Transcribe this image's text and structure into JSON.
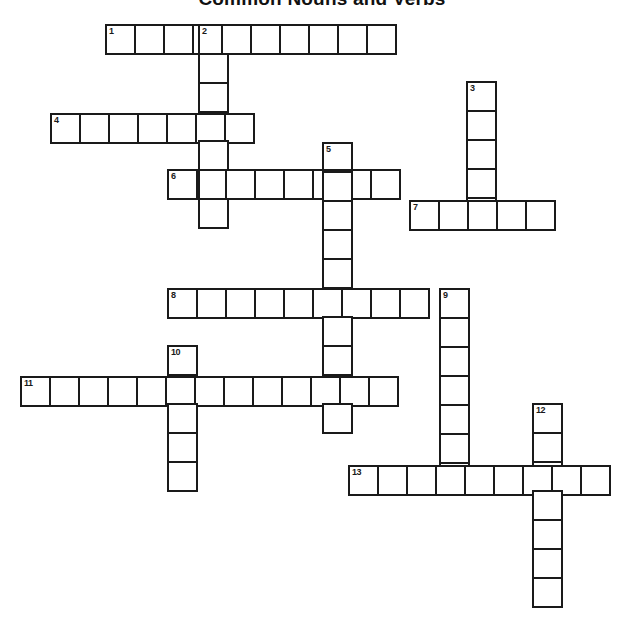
{
  "page": {
    "title": "Common Nouns and Verbs",
    "background_color": "#ffffff",
    "width": 644,
    "height": 631
  },
  "grid": {
    "cell_size": 31,
    "border_color": "#1a1a1a",
    "cell_fill": "#ffffff",
    "origin_x": 105,
    "origin_y": 24,
    "numbered_count": 13
  },
  "clue_numbers": [
    1,
    2,
    3,
    4,
    5,
    6,
    7,
    8,
    9,
    10,
    11,
    12,
    13
  ],
  "entries": [
    {
      "number": 1,
      "direction": "across",
      "length": 10,
      "x": 105,
      "y": 24,
      "answer": ""
    },
    {
      "number": 2,
      "direction": "down",
      "length": 7,
      "x": 198,
      "y": 24,
      "answer": ""
    },
    {
      "number": 3,
      "direction": "down",
      "length": 5,
      "x": 466,
      "y": 81,
      "answer": ""
    },
    {
      "number": 4,
      "direction": "across",
      "length": 7,
      "x": 50,
      "y": 113,
      "answer": ""
    },
    {
      "number": 5,
      "direction": "down",
      "length": 10,
      "x": 322,
      "y": 142,
      "answer": ""
    },
    {
      "number": 6,
      "direction": "across",
      "length": 8,
      "x": 167,
      "y": 169,
      "answer": ""
    },
    {
      "number": 7,
      "direction": "across",
      "length": 5,
      "x": 409,
      "y": 200,
      "answer": ""
    },
    {
      "number": 8,
      "direction": "across",
      "length": 9,
      "x": 167,
      "y": 288,
      "answer": ""
    },
    {
      "number": 9,
      "direction": "down",
      "length": 7,
      "x": 439,
      "y": 288,
      "answer": ""
    },
    {
      "number": 10,
      "direction": "down",
      "length": 5,
      "x": 167,
      "y": 345,
      "answer": ""
    },
    {
      "number": 11,
      "direction": "across",
      "length": 13,
      "x": 20,
      "y": 376,
      "answer": ""
    },
    {
      "number": 12,
      "direction": "down",
      "length": 7,
      "x": 532,
      "y": 403,
      "answer": ""
    },
    {
      "number": 13,
      "direction": "across",
      "length": 9,
      "x": 348,
      "y": 465,
      "answer": ""
    }
  ]
}
